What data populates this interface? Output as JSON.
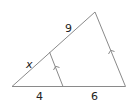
{
  "diagram": {
    "type": "triangle-parallel-segment",
    "labels": {
      "top_segment": "9",
      "lower_left_segment": "x",
      "base_left": "4",
      "base_right": "6"
    },
    "colors": {
      "line": "#8a8a8a",
      "text": "#222222"
    }
  }
}
